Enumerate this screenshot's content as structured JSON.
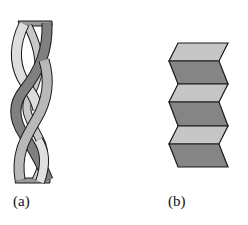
{
  "figure": {
    "panels": [
      {
        "id": "a",
        "label": "(a)",
        "description": "alpha helix ribbon (three-strand twisted coil)",
        "colors": {
          "light": "#d9d9d9",
          "mid": "#b3b3b3",
          "dark": "#7f7f7f",
          "outline": "#1a1a1a"
        }
      },
      {
        "id": "b",
        "label": "(b)",
        "description": "beta pleated sheet (zigzag folded strips)",
        "colors": {
          "light": "#c4c4c4",
          "dark": "#858585",
          "outline": "#1a1a1a"
        },
        "segments": 6
      }
    ]
  }
}
